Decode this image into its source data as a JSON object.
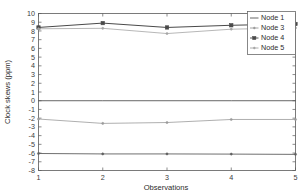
{
  "chart_data": {
    "type": "line",
    "title": "",
    "xlabel": "Observations",
    "ylabel": "Clock skews (ppm)",
    "x": [
      1,
      2,
      3,
      4,
      5
    ],
    "xlim": [
      1,
      5
    ],
    "ylim": [
      -8,
      10
    ],
    "xticks": [
      "1",
      "2",
      "3",
      "4",
      "5"
    ],
    "yticks": [
      "10",
      "9",
      "8",
      "7",
      "6",
      "5",
      "4",
      "3",
      "2",
      "1",
      "0",
      "-1",
      "-2",
      "-3",
      "-4",
      "-5",
      "-6",
      "-7",
      "-8"
    ],
    "grid": false,
    "legend_position": "top-right",
    "series": [
      {
        "name": "Node 1",
        "values": [
          0,
          0,
          0,
          0,
          0
        ],
        "color": "#555555",
        "marker": "none",
        "width": 0.9
      },
      {
        "name": "Node 3",
        "values": [
          -2.1,
          -2.6,
          -2.5,
          -2.15,
          -2.15
        ],
        "color": "#9a9a9a",
        "marker": "dot",
        "width": 0.8
      },
      {
        "name": "Node 4",
        "values": [
          8.4,
          8.9,
          8.4,
          8.65,
          8.8
        ],
        "color": "#4a4a4a",
        "marker": "square",
        "width": 1.0
      },
      {
        "name": "Node 5",
        "values": [
          8.25,
          8.3,
          7.7,
          8.2,
          8.35
        ],
        "color": "#a5a5a5",
        "marker": "dot",
        "width": 0.8
      },
      {
        "name": "Node 2",
        "values": [
          -6.05,
          -6.1,
          -6.1,
          -6.12,
          -6.15
        ],
        "color": "#5f5f5f",
        "marker": "dot",
        "width": 0.9
      }
    ],
    "legend_entries": [
      "Node 1",
      "Node 3",
      "Node 4",
      "Node 5"
    ]
  },
  "axes": {
    "x_title": "Observations",
    "y_title": "Clock skews (ppm)"
  }
}
